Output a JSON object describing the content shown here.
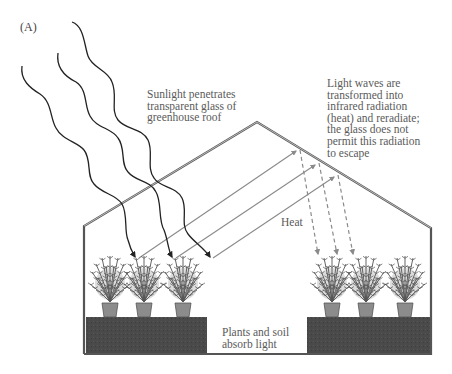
{
  "figure": {
    "panel_label": "(A)",
    "labels": {
      "sunlight": "Sunlight penetrates\ntransparent glass of\ngreenhouse roof",
      "infrared": "Light waves are\ntransformed into\ninfrared radiation\n(heat) and reradiate;\nthe glass does not\npermit this radiation\nto escape",
      "heat": "Heat",
      "absorb": "Plants and soil\nabsorb light"
    },
    "colors": {
      "outline": "#555555",
      "wave": "#222222",
      "reflected": "#8a8a8a",
      "dashed": "#8a8a8a",
      "soil": "#4a4a4a",
      "pot": "#8c8c8c",
      "foliage": "#555555",
      "text": "#5a5a5a"
    },
    "plants": {
      "left_group_x": [
        110,
        144,
        183
      ],
      "right_group_x": [
        332,
        366,
        405
      ]
    }
  }
}
